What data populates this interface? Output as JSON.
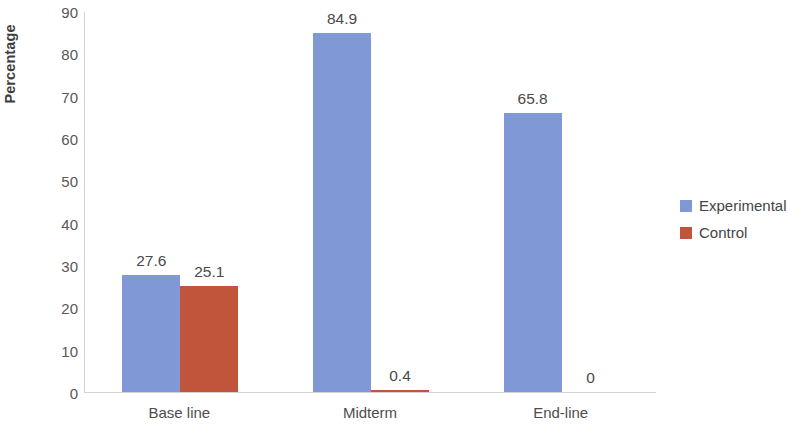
{
  "chart_data": {
    "type": "bar",
    "title": "",
    "subtitle": "",
    "xlabel": "",
    "ylabel": "Percentage",
    "categories": [
      "Base line",
      "Midterm",
      "End-line"
    ],
    "series": [
      {
        "name": "Experimental",
        "color": "#8099d6",
        "values": [
          27.6,
          84.9,
          65.8
        ],
        "labels": [
          "27.6",
          "84.9",
          "65.8"
        ]
      },
      {
        "name": "Control",
        "color": "#c0553c",
        "values": [
          25.1,
          0.4,
          0
        ],
        "labels": [
          "25.1",
          "0.4",
          "0"
        ]
      }
    ],
    "ylim": [
      0,
      90
    ],
    "yticks": [
      90,
      80,
      70,
      60,
      50,
      40,
      30,
      20,
      10,
      0
    ],
    "ytick_labels": [
      "90",
      "80",
      "70",
      "60",
      "50",
      "40",
      "30",
      "20",
      "10",
      "0"
    ],
    "grid": false,
    "legend_position": "right",
    "axis_color": "#d2d2d2",
    "background": "#ffffff"
  },
  "legend": {
    "entries": [
      {
        "label": "Experimental",
        "color": "#8099d6"
      },
      {
        "label": "Control",
        "color": "#c0553c"
      }
    ]
  }
}
